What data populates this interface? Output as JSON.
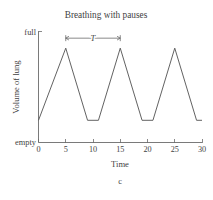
{
  "chart_data": {
    "type": "line",
    "title": "Breathing with pauses",
    "xlabel": "Time",
    "ylabel": "Volume of lung",
    "xlim": [
      0,
      30
    ],
    "ylim": [
      0,
      1
    ],
    "grid": false,
    "legend": null,
    "xticks": [
      0,
      5,
      10,
      15,
      20,
      25,
      30
    ],
    "xticklabels": [
      "0",
      "5",
      "10",
      "15",
      "20",
      "25",
      "30"
    ],
    "yticklabels": [
      "empty",
      "full"
    ],
    "y_bottom_label": "empty",
    "y_top_label": "full",
    "series": [
      {
        "name": "lung volume",
        "x": [
          0,
          5,
          9,
          11,
          15,
          19,
          21,
          25,
          29,
          30
        ],
        "y": [
          0.2,
          0.85,
          0.2,
          0.2,
          0.85,
          0.2,
          0.2,
          0.85,
          0.2,
          0.2
        ]
      }
    ],
    "annotations": [
      {
        "label": "T",
        "kind": "double-arrow",
        "x_start": 5,
        "x_end": 15,
        "y": 0.94
      }
    ],
    "caption": "c",
    "colors": {
      "line": "#5a5a5a",
      "axis": "#6b6b6b",
      "text": "#3f3f3f",
      "background": "#ffffff"
    }
  }
}
